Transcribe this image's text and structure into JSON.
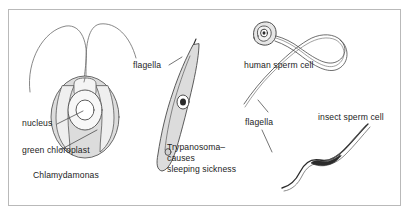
{
  "figure": {
    "background": "#ffffff",
    "frame_color": "#b9b9b9",
    "ink_color": "#1d1d1d",
    "cell_fill": "#dcdcdc",
    "outline_color": "#555555"
  },
  "labels": {
    "flagella_left": "flagella",
    "nucleus": "nucleus",
    "green_chloroplast": "green chloroplast",
    "chlamydomonas": "Chlamydamonas",
    "trypanosoma": "Trypanosoma–\ncauses\nsleeping sickness",
    "human_sperm": "human sperm cell",
    "flagella_right": "flagella",
    "insect_sperm": "insect sperm cell"
  },
  "organisms": [
    {
      "name": "Chlamydamonas",
      "parts": [
        "flagella",
        "nucleus",
        "green chloroplast"
      ]
    },
    {
      "name": "Trypanosoma",
      "note": "causes sleeping sickness",
      "parts": [
        "flagella"
      ]
    },
    {
      "name": "human sperm cell",
      "parts": [
        "flagellum"
      ]
    },
    {
      "name": "insect sperm cell",
      "parts": [
        "flagellum"
      ]
    }
  ]
}
